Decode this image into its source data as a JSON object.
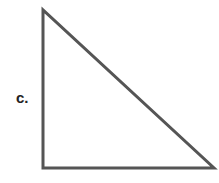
{
  "figure": {
    "label": "c.",
    "shape": "right-triangle",
    "stroke_color": "#555555",
    "vertices": [
      [
        43,
        10
      ],
      [
        43,
        168
      ],
      [
        214,
        168
      ]
    ]
  }
}
